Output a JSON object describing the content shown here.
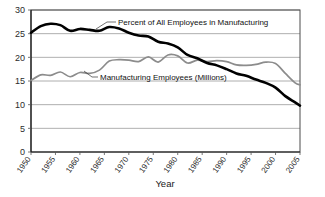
{
  "chart_data": {
    "type": "line",
    "title": "",
    "xlabel": "Year",
    "ylabel": "",
    "xlim": [
      1950,
      2005
    ],
    "ylim": [
      0,
      30
    ],
    "ytick_step": 5,
    "xtick_step": 5,
    "grid": true,
    "legend_position": "inline-annotation",
    "xticks": [
      "1950",
      "1955",
      "1960",
      "1965",
      "1970",
      "1975",
      "1980",
      "1985",
      "1990",
      "1995",
      "2000",
      "2005"
    ],
    "yticks": [
      "0",
      "5",
      "10",
      "15",
      "20",
      "25",
      "30"
    ],
    "x": [
      1950,
      1952,
      1954,
      1956,
      1958,
      1960,
      1962,
      1964,
      1966,
      1968,
      1970,
      1972,
      1974,
      1976,
      1978,
      1980,
      1982,
      1984,
      1986,
      1988,
      1990,
      1992,
      1994,
      1996,
      1998,
      2000,
      2002,
      2004,
      2005
    ],
    "series": [
      {
        "name": "Percent of All Employees in Manufacturing",
        "color": "#000000",
        "label_text": "Percent of All Employees in Manufacturing",
        "units": "percent",
        "values": [
          25.2,
          26.6,
          27.1,
          26.8,
          25.6,
          26.0,
          25.8,
          25.6,
          26.4,
          26.1,
          25.2,
          24.6,
          24.4,
          23.3,
          22.9,
          22.1,
          20.5,
          19.8,
          18.8,
          18.3,
          17.5,
          16.6,
          16.1,
          15.3,
          14.6,
          13.6,
          11.8,
          10.5,
          9.8
        ]
      },
      {
        "name": "Manufacturing Employees (Millions)",
        "color": "#8c8c8c",
        "label_text": "Manufacturing Employees (Millions)",
        "units": "millions",
        "values": [
          15.1,
          16.3,
          16.2,
          16.9,
          15.9,
          16.8,
          16.6,
          17.3,
          19.2,
          19.5,
          19.4,
          19.1,
          20.1,
          19.0,
          20.5,
          20.3,
          18.8,
          19.4,
          19.1,
          19.3,
          19.1,
          18.4,
          18.3,
          18.5,
          19.0,
          18.7,
          16.6,
          14.6,
          14.2
        ]
      }
    ],
    "annotations": [
      {
        "text": "Percent of All Employees in Manufacturing",
        "series": "black"
      },
      {
        "text": "Manufacturing Employees (Millions)",
        "series": "grey"
      }
    ]
  }
}
